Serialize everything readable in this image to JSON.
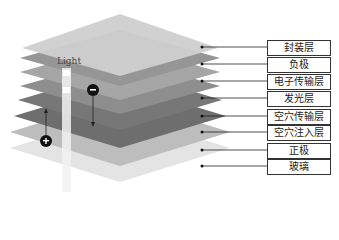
{
  "diagram": {
    "light_label": "Light",
    "layers": [
      {
        "label": "封装层",
        "color": "#c8c8c8"
      },
      {
        "label": "负极",
        "color": "#9a9a9a"
      },
      {
        "label": "电子传输层",
        "color": "#a8a8a8"
      },
      {
        "label": "发光层",
        "color": "#8a8a8a"
      },
      {
        "label": "空穴传输层",
        "color": "#707070"
      },
      {
        "label": "空穴注入层",
        "color": "#6a6a6a"
      },
      {
        "label": "正极",
        "color": "#bdbdbd"
      },
      {
        "label": "玻璃",
        "color": "#e6e6e6"
      }
    ],
    "charges": {
      "electron": "−",
      "hole": "+"
    }
  }
}
